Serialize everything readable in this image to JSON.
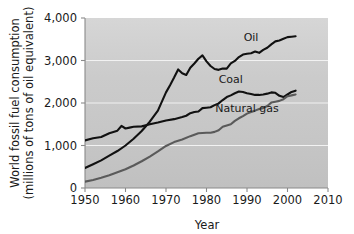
{
  "chart_data": {
    "type": "line",
    "title": "",
    "xlabel": "Year",
    "ylabel": "World fossil fuel consumption (millions of tons of oil equivalent)",
    "ylabel_line1": "World fossil fuel consumption",
    "ylabel_line2": "(millions of tons of oil equivalent)",
    "xlim": [
      1950,
      2010
    ],
    "ylim": [
      0,
      4000
    ],
    "xticks": [
      1950,
      1960,
      1970,
      1980,
      1990,
      2000,
      2010
    ],
    "xtick_labels": [
      "1950",
      "1960",
      "1970",
      "1980",
      "1990",
      "2000",
      "2010"
    ],
    "yticks": [
      0,
      1000,
      2000,
      3000,
      4000
    ],
    "ytick_labels": [
      "0",
      "1,000",
      "2,000",
      "3,000",
      "4,000"
    ],
    "grid": "horizontal-white",
    "legend_position": "inline-annotations",
    "plot_background": "#c9c9c9",
    "series": [
      {
        "name": "Oil",
        "color": "#111111",
        "label_x": 1991,
        "label_y": 3450,
        "x": [
          1950,
          1952,
          1954,
          1956,
          1958,
          1960,
          1962,
          1964,
          1966,
          1968,
          1970,
          1971,
          1972,
          1973,
          1974,
          1975,
          1976,
          1977,
          1978,
          1979,
          1980,
          1981,
          1982,
          1983,
          1984,
          1985,
          1986,
          1987,
          1988,
          1989,
          1990,
          1991,
          1992,
          1993,
          1994,
          1995,
          1996,
          1997,
          1998,
          1999,
          2000,
          2001,
          2002
        ],
        "values": [
          470,
          560,
          650,
          760,
          870,
          1000,
          1160,
          1340,
          1560,
          1820,
          2250,
          2420,
          2600,
          2790,
          2700,
          2660,
          2830,
          2930,
          3040,
          3120,
          2980,
          2870,
          2800,
          2780,
          2810,
          2810,
          2930,
          2990,
          3080,
          3140,
          3160,
          3170,
          3210,
          3180,
          3250,
          3300,
          3380,
          3450,
          3470,
          3510,
          3550,
          3560,
          3570
        ]
      },
      {
        "name": "Coal",
        "color": "#111111",
        "label_x": 1986,
        "label_y": 2470,
        "x": [
          1950,
          1952,
          1954,
          1956,
          1958,
          1959,
          1960,
          1961,
          1962,
          1964,
          1966,
          1968,
          1970,
          1972,
          1974,
          1975,
          1976,
          1977,
          1978,
          1979,
          1980,
          1981,
          1982,
          1983,
          1984,
          1985,
          1986,
          1987,
          1988,
          1989,
          1990,
          1991,
          1992,
          1993,
          1994,
          1995,
          1996,
          1997,
          1998,
          1999,
          2000,
          2001,
          2002
        ],
        "values": [
          1120,
          1170,
          1200,
          1290,
          1350,
          1460,
          1400,
          1420,
          1440,
          1450,
          1500,
          1540,
          1590,
          1620,
          1670,
          1700,
          1760,
          1790,
          1800,
          1880,
          1890,
          1900,
          1950,
          1990,
          2070,
          2140,
          2180,
          2230,
          2270,
          2260,
          2230,
          2210,
          2190,
          2190,
          2200,
          2220,
          2250,
          2240,
          2170,
          2140,
          2200,
          2260,
          2290
        ]
      },
      {
        "name": "Natural gas",
        "color": "#5a5a5a",
        "label_x": 1990,
        "label_y": 1780,
        "x": [
          1950,
          1952,
          1954,
          1956,
          1958,
          1960,
          1962,
          1964,
          1966,
          1968,
          1970,
          1972,
          1974,
          1976,
          1978,
          1980,
          1981,
          1982,
          1983,
          1984,
          1985,
          1986,
          1987,
          1988,
          1989,
          1990,
          1991,
          1992,
          1993,
          1994,
          1995,
          1996,
          1997,
          1998,
          1999,
          2000,
          2001,
          2002
        ],
        "values": [
          150,
          190,
          240,
          300,
          370,
          440,
          530,
          630,
          740,
          860,
          990,
          1080,
          1140,
          1220,
          1290,
          1300,
          1300,
          1320,
          1360,
          1440,
          1470,
          1500,
          1580,
          1640,
          1690,
          1750,
          1790,
          1820,
          1860,
          1880,
          1930,
          2010,
          2030,
          2050,
          2090,
          2160,
          2180,
          2200
        ]
      }
    ]
  }
}
